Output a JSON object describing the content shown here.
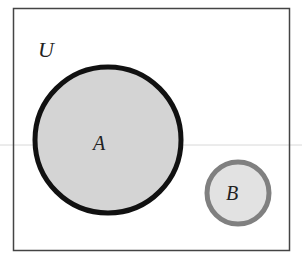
{
  "diagram": {
    "type": "venn",
    "universe": {
      "label": "U",
      "x": 13,
      "y": 8,
      "width": 276,
      "height": 242,
      "stroke": "#444444"
    },
    "sets": [
      {
        "label": "A",
        "cx": 108,
        "cy": 140,
        "r": 73,
        "fill": "#d4d4d4",
        "stroke": "#111111",
        "stroke_width": 5
      },
      {
        "label": "B",
        "cx": 238,
        "cy": 193,
        "r": 31,
        "fill": "#e2e2e2",
        "stroke": "#808080",
        "stroke_width": 5
      }
    ],
    "relationship": "disjoint"
  }
}
